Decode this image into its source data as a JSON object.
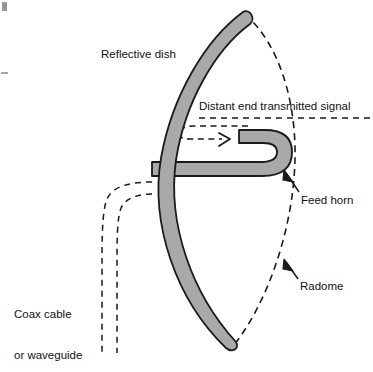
{
  "diagram": {
    "type": "technical-line-drawing",
    "colors": {
      "dish_fill": "#a9a9a9",
      "outline": "#1a1a1a",
      "background": "#ffffff",
      "text": "#111111",
      "dashed_line": "#1a1a1a"
    },
    "labels": {
      "reflective_dish": "Reflective dish",
      "distant_signal": "Distant end transmitted signal",
      "feed_horn": "Feed horn",
      "radome": "Radome",
      "coax_line1": "Coax cable",
      "coax_line2": "or waveguide"
    },
    "parts": [
      {
        "name": "reflective-dish",
        "style": "solid filled grey parabolic arc",
        "label": "Reflective dish"
      },
      {
        "name": "feed-horn",
        "style": "solid filled grey J-shaped hook",
        "label": "Feed horn"
      },
      {
        "name": "radome",
        "style": "dashed arc enclosing dish opening",
        "label": "Radome"
      },
      {
        "name": "coax-cable",
        "style": "two parallel dashed lines",
        "label": "Coax cable or waveguide"
      },
      {
        "name": "signal-path",
        "style": "dashed path with arrowhead into horn",
        "label": "Distant end transmitted signal"
      }
    ]
  }
}
